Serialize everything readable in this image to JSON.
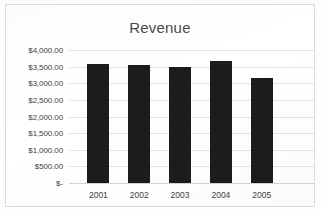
{
  "chart_data": {
    "type": "bar",
    "title": "Revenue",
    "xlabel": "",
    "ylabel": "",
    "categories": [
      "2001",
      "2002",
      "2003",
      "2004",
      "2005"
    ],
    "values": [
      3570,
      3540,
      3500,
      3680,
      3150
    ],
    "series": [
      {
        "name": "Revenue",
        "values": [
          3570,
          3540,
          3500,
          3680,
          3150
        ]
      }
    ],
    "ylim": [
      0,
      4000
    ],
    "ytick_values": [
      0,
      500,
      1000,
      1500,
      2000,
      2500,
      3000,
      3500,
      4000
    ],
    "ytick_labels": [
      "$-",
      "$500.00",
      "$1,000.00",
      "$1,500.00",
      "$2,000.00",
      "$2,500.00",
      "$3,000.00",
      "$3,500.00",
      "$4,000.00"
    ],
    "grid": true,
    "legend": false,
    "legend_position": "none",
    "bar_color": "#1c1c1c",
    "gridline_color": "#e3e3e3",
    "title_color": "#4a4a4a",
    "tick_label_color": "#3f3f3f",
    "background_color": "#ffffff",
    "border_color": "#dcdcdc"
  }
}
